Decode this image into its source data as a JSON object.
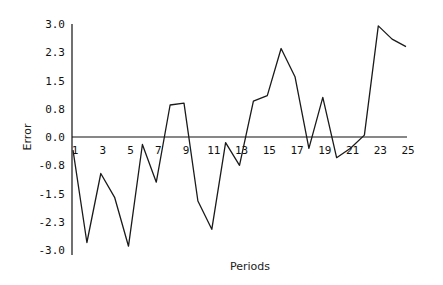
{
  "chart_data": {
    "type": "line",
    "title": "",
    "xlabel": "Periods",
    "ylabel": "Error",
    "x": [
      1,
      2,
      3,
      4,
      5,
      6,
      7,
      8,
      9,
      10,
      11,
      12,
      13,
      14,
      15,
      16,
      17,
      18,
      19,
      20,
      21,
      22,
      23,
      24,
      25
    ],
    "series": [
      {
        "name": "Error",
        "values": [
          -0.35,
          -2.8,
          -0.97,
          -1.6,
          -2.9,
          -0.2,
          -1.2,
          0.85,
          0.9,
          -1.7,
          -2.45,
          -0.15,
          -0.75,
          0.95,
          1.1,
          2.35,
          1.6,
          -0.3,
          1.05,
          -0.55,
          -0.3,
          0.05,
          2.95,
          2.6,
          2.4
        ]
      }
    ],
    "x_tick_labels": [
      "1",
      "3",
      "5",
      "7",
      "9",
      "11",
      "13",
      "15",
      "17",
      "19",
      "21",
      "23",
      "25"
    ],
    "y_tick_labels": [
      "3.0",
      "2.3",
      "1.5",
      "0.8",
      "0.0",
      "-0.8",
      "-1.5",
      "-2.3",
      "-3.0"
    ],
    "y_tick_values": [
      3.0,
      2.25,
      1.5,
      0.75,
      0.0,
      -0.75,
      -1.5,
      -2.25,
      -3.0
    ],
    "ylim": [
      -3.0,
      3.0
    ],
    "xlim": [
      1,
      25
    ],
    "grid": false,
    "legend": "none",
    "line_color": "#1a1a1a"
  }
}
